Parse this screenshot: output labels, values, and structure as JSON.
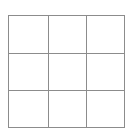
{
  "figure": {
    "kind": "grid-diagram",
    "title": "",
    "rows": 3,
    "columns": 3,
    "line_color": "#8c8c8c",
    "cell_fill": "#ffffff",
    "background": "#ffffff",
    "line_width_px": 1
  },
  "grid": {
    "cells": [
      [
        {
          "label": ""
        },
        {
          "label": ""
        },
        {
          "label": ""
        }
      ],
      [
        {
          "label": ""
        },
        {
          "label": ""
        },
        {
          "label": ""
        }
      ],
      [
        {
          "label": ""
        },
        {
          "label": ""
        },
        {
          "label": ""
        }
      ]
    ]
  }
}
